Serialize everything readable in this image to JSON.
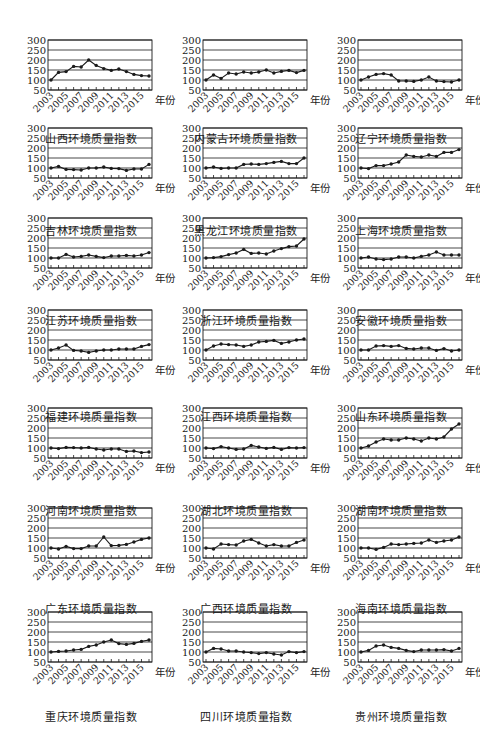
{
  "figure": {
    "x_unit_label": "年份",
    "y_ticks": [
      50,
      100,
      150,
      200,
      250,
      300
    ],
    "x_tick_labels": [
      "2003",
      "2005",
      "2007",
      "2009",
      "2011",
      "2013",
      "2015"
    ],
    "line_color": "#1a1a1a",
    "grid_color": "#1a1a1a"
  },
  "chart_data": [
    {
      "type": "line",
      "title": "山西环境质量指数",
      "xlabel": "年份",
      "ylabel": "",
      "ylim": [
        50,
        300
      ],
      "grid": true,
      "x": [
        2003,
        2004,
        2005,
        2006,
        2007,
        2008,
        2009,
        2010,
        2011,
        2012,
        2013,
        2014,
        2015,
        2016
      ],
      "values": [
        100,
        138,
        142,
        168,
        165,
        200,
        173,
        157,
        148,
        155,
        142,
        128,
        122,
        120
      ]
    },
    {
      "type": "line",
      "title": "内蒙古环境质量指数",
      "xlabel": "年份",
      "ylabel": "",
      "ylim": [
        50,
        300
      ],
      "grid": true,
      "x": [
        2003,
        2004,
        2005,
        2006,
        2007,
        2008,
        2009,
        2010,
        2011,
        2012,
        2013,
        2014,
        2015,
        2016
      ],
      "values": [
        100,
        125,
        108,
        135,
        130,
        140,
        135,
        140,
        150,
        135,
        143,
        148,
        137,
        148
      ]
    },
    {
      "type": "line",
      "title": "辽宁环境质量指数",
      "xlabel": "年份",
      "ylabel": "",
      "ylim": [
        50,
        300
      ],
      "grid": true,
      "x": [
        2003,
        2004,
        2005,
        2006,
        2007,
        2008,
        2009,
        2010,
        2011,
        2012,
        2013,
        2014,
        2015,
        2016
      ],
      "values": [
        100,
        115,
        128,
        132,
        125,
        95,
        95,
        93,
        100,
        115,
        95,
        92,
        90,
        100
      ]
    },
    {
      "type": "line",
      "title": "吉林环境质量指数",
      "xlabel": "年份",
      "ylabel": "",
      "ylim": [
        50,
        300
      ],
      "grid": true,
      "x": [
        2003,
        2004,
        2005,
        2006,
        2007,
        2008,
        2009,
        2010,
        2011,
        2012,
        2013,
        2014,
        2015,
        2016
      ],
      "values": [
        100,
        108,
        93,
        92,
        90,
        100,
        100,
        105,
        98,
        97,
        88,
        95,
        95,
        118
      ]
    },
    {
      "type": "line",
      "title": "黑龙江环境质量指数",
      "xlabel": "年份",
      "ylabel": "",
      "ylim": [
        50,
        300
      ],
      "grid": true,
      "x": [
        2003,
        2004,
        2005,
        2006,
        2007,
        2008,
        2009,
        2010,
        2011,
        2012,
        2013,
        2014,
        2015,
        2016
      ],
      "values": [
        100,
        105,
        98,
        100,
        100,
        118,
        120,
        118,
        122,
        128,
        133,
        122,
        122,
        150
      ]
    },
    {
      "type": "line",
      "title": "上海环境质量指数",
      "xlabel": "年份",
      "ylabel": "",
      "ylim": [
        50,
        300
      ],
      "grid": true,
      "x": [
        2003,
        2004,
        2005,
        2006,
        2007,
        2008,
        2009,
        2010,
        2011,
        2012,
        2013,
        2014,
        2015,
        2016
      ],
      "values": [
        100,
        97,
        112,
        112,
        120,
        130,
        165,
        158,
        155,
        165,
        158,
        178,
        178,
        192
      ]
    },
    {
      "type": "line",
      "title": "江苏环境质量指数",
      "xlabel": "年份",
      "ylabel": "",
      "ylim": [
        50,
        300
      ],
      "grid": true,
      "x": [
        2003,
        2004,
        2005,
        2006,
        2007,
        2008,
        2009,
        2010,
        2011,
        2012,
        2013,
        2014,
        2015,
        2016
      ],
      "values": [
        100,
        100,
        118,
        105,
        108,
        115,
        108,
        102,
        110,
        110,
        113,
        110,
        115,
        127
      ]
    },
    {
      "type": "line",
      "title": "浙江环境质量指数",
      "xlabel": "年份",
      "ylabel": "",
      "ylim": [
        50,
        300
      ],
      "grid": true,
      "x": [
        2003,
        2004,
        2005,
        2006,
        2007,
        2008,
        2009,
        2010,
        2011,
        2012,
        2013,
        2014,
        2015,
        2016
      ],
      "values": [
        100,
        102,
        107,
        117,
        125,
        143,
        123,
        125,
        120,
        135,
        147,
        157,
        160,
        195
      ]
    },
    {
      "type": "line",
      "title": "安徽环境质量指数",
      "xlabel": "年份",
      "ylabel": "",
      "ylim": [
        50,
        300
      ],
      "grid": true,
      "x": [
        2003,
        2004,
        2005,
        2006,
        2007,
        2008,
        2009,
        2010,
        2011,
        2012,
        2013,
        2014,
        2015,
        2016
      ],
      "values": [
        100,
        105,
        95,
        92,
        95,
        105,
        105,
        100,
        108,
        115,
        130,
        115,
        115,
        115
      ]
    },
    {
      "type": "line",
      "title": "福建环境质量指数",
      "xlabel": "年份",
      "ylabel": "",
      "ylim": [
        50,
        300
      ],
      "grid": true,
      "x": [
        2003,
        2004,
        2005,
        2006,
        2007,
        2008,
        2009,
        2010,
        2011,
        2012,
        2013,
        2014,
        2015,
        2016
      ],
      "values": [
        100,
        110,
        125,
        98,
        95,
        88,
        95,
        100,
        100,
        105,
        105,
        105,
        118,
        127
      ]
    },
    {
      "type": "line",
      "title": "江西环境质量指数",
      "xlabel": "年份",
      "ylabel": "",
      "ylim": [
        50,
        300
      ],
      "grid": true,
      "x": [
        2003,
        2004,
        2005,
        2006,
        2007,
        2008,
        2009,
        2010,
        2011,
        2012,
        2013,
        2014,
        2015,
        2016
      ],
      "values": [
        100,
        120,
        130,
        127,
        125,
        118,
        125,
        140,
        143,
        148,
        133,
        140,
        150,
        155
      ]
    },
    {
      "type": "line",
      "title": "山东环境质量指数",
      "xlabel": "年份",
      "ylabel": "",
      "ylim": [
        50,
        300
      ],
      "grid": true,
      "x": [
        2003,
        2004,
        2005,
        2006,
        2007,
        2008,
        2009,
        2010,
        2011,
        2012,
        2013,
        2014,
        2015,
        2016
      ],
      "values": [
        100,
        100,
        120,
        122,
        118,
        122,
        108,
        105,
        110,
        110,
        98,
        107,
        95,
        100
      ]
    },
    {
      "type": "line",
      "title": "河南环境质量指数",
      "xlabel": "年份",
      "ylabel": "",
      "ylim": [
        50,
        300
      ],
      "grid": true,
      "x": [
        2003,
        2004,
        2005,
        2006,
        2007,
        2008,
        2009,
        2010,
        2011,
        2012,
        2013,
        2014,
        2015,
        2016
      ],
      "values": [
        100,
        97,
        103,
        102,
        100,
        103,
        95,
        90,
        95,
        95,
        83,
        85,
        77,
        80
      ]
    },
    {
      "type": "line",
      "title": "湖北环境质量指数",
      "xlabel": "年份",
      "ylabel": "",
      "ylim": [
        50,
        300
      ],
      "grid": true,
      "x": [
        2003,
        2004,
        2005,
        2006,
        2007,
        2008,
        2009,
        2010,
        2011,
        2012,
        2013,
        2014,
        2015,
        2016
      ],
      "values": [
        100,
        97,
        107,
        100,
        93,
        95,
        113,
        105,
        98,
        103,
        93,
        102,
        100,
        102
      ]
    },
    {
      "type": "line",
      "title": "湖南环境质量指数",
      "xlabel": "年份",
      "ylabel": "",
      "ylim": [
        50,
        300
      ],
      "grid": true,
      "x": [
        2003,
        2004,
        2005,
        2006,
        2007,
        2008,
        2009,
        2010,
        2011,
        2012,
        2013,
        2014,
        2015,
        2016
      ],
      "values": [
        100,
        110,
        130,
        145,
        140,
        140,
        150,
        145,
        135,
        150,
        145,
        155,
        195,
        220
      ]
    },
    {
      "type": "line",
      "title": "广东环境质量指数",
      "xlabel": "年份",
      "ylabel": "",
      "ylim": [
        50,
        300
      ],
      "grid": true,
      "x": [
        2003,
        2004,
        2005,
        2006,
        2007,
        2008,
        2009,
        2010,
        2011,
        2012,
        2013,
        2014,
        2015,
        2016
      ],
      "values": [
        100,
        95,
        108,
        97,
        97,
        110,
        110,
        155,
        112,
        113,
        118,
        130,
        143,
        150
      ]
    },
    {
      "type": "line",
      "title": "广西环境质量指数",
      "xlabel": "年份",
      "ylabel": "",
      "ylim": [
        50,
        300
      ],
      "grid": true,
      "x": [
        2003,
        2004,
        2005,
        2006,
        2007,
        2008,
        2009,
        2010,
        2011,
        2012,
        2013,
        2014,
        2015,
        2016
      ],
      "values": [
        100,
        95,
        120,
        117,
        115,
        135,
        143,
        125,
        110,
        117,
        110,
        110,
        128,
        140
      ]
    },
    {
      "type": "line",
      "title": "海南环境质量指数",
      "xlabel": "年份",
      "ylabel": "",
      "ylim": [
        50,
        300
      ],
      "grid": true,
      "x": [
        2003,
        2004,
        2005,
        2006,
        2007,
        2008,
        2009,
        2010,
        2011,
        2012,
        2013,
        2014,
        2015,
        2016
      ],
      "values": [
        100,
        100,
        93,
        103,
        120,
        117,
        120,
        123,
        125,
        140,
        128,
        135,
        140,
        155
      ]
    },
    {
      "type": "line",
      "title": "重庆环境质量指数",
      "xlabel": "年份",
      "ylabel": "",
      "ylim": [
        50,
        300
      ],
      "grid": true,
      "x": [
        2003,
        2004,
        2005,
        2006,
        2007,
        2008,
        2009,
        2010,
        2011,
        2012,
        2013,
        2014,
        2015,
        2016
      ],
      "values": [
        100,
        103,
        105,
        110,
        113,
        128,
        135,
        150,
        160,
        142,
        138,
        143,
        153,
        160
      ]
    },
    {
      "type": "line",
      "title": "四川环境质量指数",
      "xlabel": "年份",
      "ylabel": "",
      "ylim": [
        50,
        300
      ],
      "grid": true,
      "x": [
        2003,
        2004,
        2005,
        2006,
        2007,
        2008,
        2009,
        2010,
        2011,
        2012,
        2013,
        2014,
        2015,
        2016
      ],
      "values": [
        100,
        118,
        115,
        105,
        105,
        100,
        97,
        92,
        97,
        90,
        85,
        102,
        97,
        102
      ]
    },
    {
      "type": "line",
      "title": "贵州环境质量指数",
      "xlabel": "年份",
      "ylabel": "",
      "ylim": [
        50,
        300
      ],
      "grid": true,
      "x": [
        2003,
        2004,
        2005,
        2006,
        2007,
        2008,
        2009,
        2010,
        2011,
        2012,
        2013,
        2014,
        2015,
        2016
      ],
      "values": [
        100,
        108,
        130,
        135,
        123,
        118,
        108,
        102,
        110,
        110,
        110,
        112,
        105,
        118
      ]
    }
  ]
}
